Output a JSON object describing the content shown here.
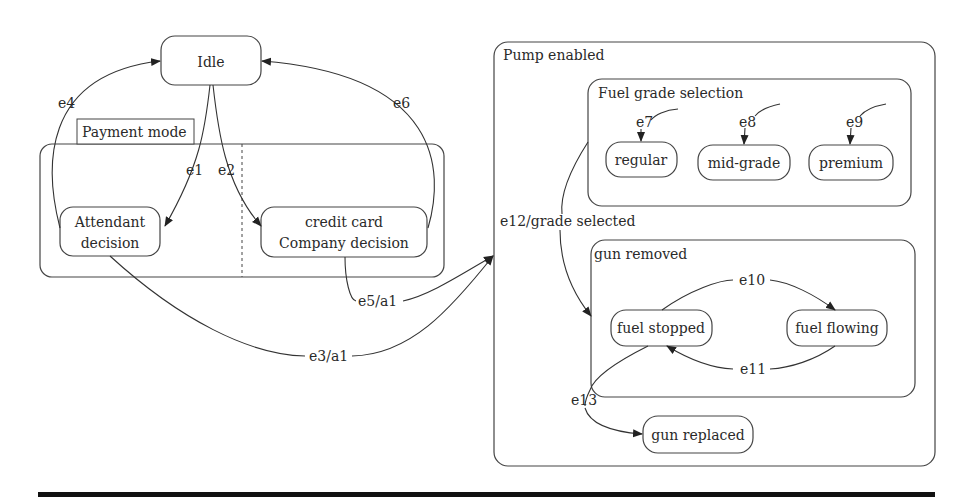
{
  "states": {
    "idle": "Idle",
    "payment_mode": "Payment mode",
    "attendant_1": "Attendant",
    "attendant_2": "decision",
    "credit_1": "credit card",
    "credit_2": "Company decision",
    "pump_enabled": "Pump enabled",
    "fuel_grade_selection": "Fuel grade selection",
    "regular": "regular",
    "mid_grade": "mid-grade",
    "premium": "premium",
    "gun_removed": "gun removed",
    "fuel_stopped": "fuel stopped",
    "fuel_flowing": "fuel flowing",
    "gun_replaced": "gun replaced"
  },
  "transitions": {
    "e1": "e1",
    "e2": "e2",
    "e3": "e3/a1",
    "e4": "e4",
    "e5": "e5/a1",
    "e6": "e6",
    "e7": "e7",
    "e8": "e8",
    "e9": "e9",
    "e10": "e10",
    "e11": "e11",
    "e12": "e12/grade selected",
    "e13": "e13"
  }
}
